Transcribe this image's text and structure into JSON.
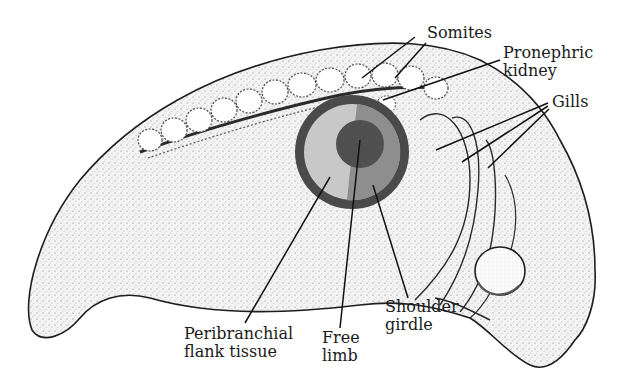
{
  "figure": {
    "colors": {
      "background": "#ffffff",
      "outline": "#1e1e1e",
      "body_fill": "#ededed",
      "stipple": "#8a8a8a",
      "limb_outer_ring": "#4a4a4a",
      "peribranchial_flank": "#c8c8c8",
      "shoulder_girdle": "#8e8e8e",
      "free_limb": "#4f4f4f",
      "leader_line": "#111111"
    }
  },
  "labels": {
    "somites": {
      "lines": [
        "Somites"
      ]
    },
    "pronephric_kidney": {
      "lines": [
        "Pronephric",
        "kidney"
      ]
    },
    "gills": {
      "lines": [
        "Gills"
      ]
    },
    "peribranchial": {
      "lines": [
        "Peribranchial",
        "flank tissue"
      ]
    },
    "free_limb": {
      "lines": [
        "Free",
        "limb"
      ]
    },
    "shoulder_girdle": {
      "lines": [
        "Shoulder",
        "girdle"
      ]
    }
  }
}
